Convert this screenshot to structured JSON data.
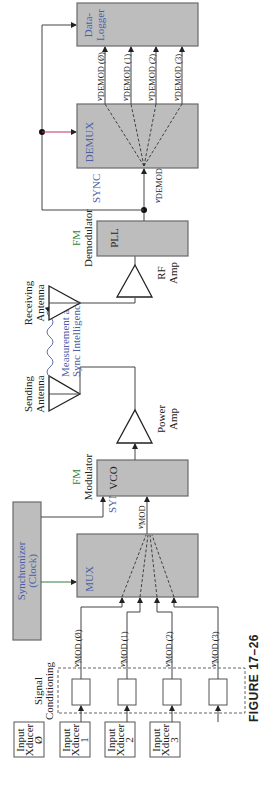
{
  "figure": {
    "caption": "FIGURE 17–26"
  },
  "blocks": {
    "data_logger": {
      "line1": "Data-",
      "line2": "Logger"
    },
    "demux": {
      "label": "DEMUX"
    },
    "pll": {
      "label": "PLL"
    },
    "fm_demodulator": {
      "line1": "FM",
      "line2": "Demodulator"
    },
    "rf_amp": {
      "line1": "RF",
      "line2": "Amp"
    },
    "receiving_antenna": {
      "line1": "Receiving",
      "line2": "Antenna"
    },
    "sending_antenna": {
      "line1": "Sending",
      "line2": "Antenna"
    },
    "power_amp": {
      "line1": "Power",
      "line2": "Amp"
    },
    "vco": {
      "label": "VCO"
    },
    "fm_modulator": {
      "line1": "FM",
      "line2": "Modulator"
    },
    "synchronizer": {
      "line1": "Synchronizer",
      "line2": "(Clock)"
    },
    "mux": {
      "label": "MUX"
    },
    "signal_conditioning": {
      "line1": "Signal",
      "line2": "Conditioning"
    }
  },
  "transmission": {
    "line1": "Measurement and",
    "line2": "Sync Intelligence"
  },
  "signals": {
    "sync_rx": "SYNC",
    "sync_tx": "SYNC",
    "v_demod_v": "v",
    "v_demod_sub": "DEMOD",
    "v_mod_v": "v",
    "v_mod_sub": "MOD",
    "demod_outputs": [
      {
        "v": "v",
        "sub": "DEMOD (Ø)"
      },
      {
        "v": "v",
        "sub": "DEMOD (1)"
      },
      {
        "v": "v",
        "sub": "DEMOD (2)"
      },
      {
        "v": "v",
        "sub": "DEMOD (3)"
      }
    ],
    "mod_inputs": [
      {
        "v": "v",
        "sub": "MOD (Ø)"
      },
      {
        "v": "v",
        "sub": "MOD (1)"
      },
      {
        "v": "v",
        "sub": "MOD (2)"
      },
      {
        "v": "v",
        "sub": "MOD (3)"
      }
    ]
  },
  "transducers": [
    {
      "line1": "Input",
      "line2": "Xducer",
      "line3": "Ø"
    },
    {
      "line1": "Input",
      "line2": "Xducer",
      "line3": "1"
    },
    {
      "line1": "Input",
      "line2": "Xducer",
      "line3": "2"
    },
    {
      "line1": "Input",
      "line2": "Xducer",
      "line3": "3"
    }
  ],
  "colors": {
    "block_fill": "#bdbdbd",
    "label_blue": "#4a5fa8",
    "label_green": "#2e7d3a"
  }
}
